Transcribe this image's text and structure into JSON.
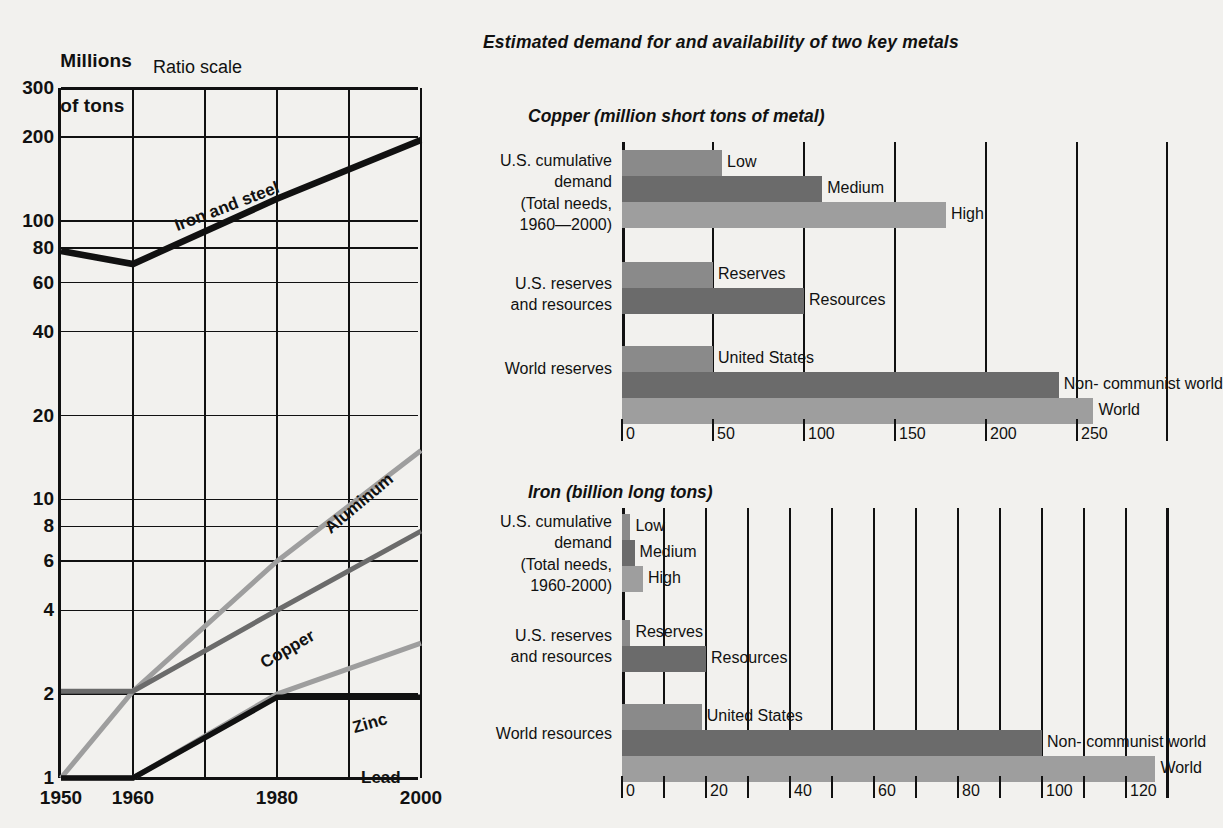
{
  "main_title": "Estimated demand for and availability of two key metals",
  "line_chart": {
    "axis_title_line1": "Millions",
    "axis_title_line2": "of tons",
    "scale_note": "Ratio scale",
    "y_ticks": [
      "300",
      "200",
      "100",
      "80",
      "60",
      "40",
      "20",
      "10",
      "8",
      "6",
      "4",
      "2",
      "1"
    ],
    "x_ticks": [
      "1950",
      "1960",
      "1980",
      "2000"
    ],
    "series_labels": [
      "Iron and steel",
      "Aluminum",
      "Copper",
      "Zinc",
      "Lead"
    ]
  },
  "copper_chart": {
    "title": "Copper (million short tons of metal)",
    "axis_ticks": [
      "0",
      "50",
      "100",
      "150",
      "200",
      "250"
    ],
    "groups": [
      {
        "label": "U.S. cumulative\ndemand\n(Total needs,\n1960—2000)",
        "bars": [
          {
            "name": "Low",
            "value": 55
          },
          {
            "name": "Medium",
            "value": 110
          },
          {
            "name": "High",
            "value": 178
          }
        ]
      },
      {
        "label": "U.S. reserves\nand resources",
        "bars": [
          {
            "name": "Reserves",
            "value": 50
          },
          {
            "name": "Resources",
            "value": 100
          }
        ]
      },
      {
        "label": "World reserves",
        "bars": [
          {
            "name": "United States",
            "value": 50
          },
          {
            "name": "Non- communist world",
            "value": 240
          },
          {
            "name": "World",
            "value": 259
          }
        ]
      }
    ]
  },
  "iron_chart": {
    "title": "Iron (billion long tons)",
    "axis_ticks": [
      "0",
      "20",
      "40",
      "60",
      "80",
      "100",
      "120"
    ],
    "groups": [
      {
        "label": "U.S. cumulative\ndemand\n(Total needs,\n1960-2000)",
        "bars": [
          {
            "name": "Low",
            "value": 2
          },
          {
            "name": "Medium",
            "value": 3
          },
          {
            "name": "High",
            "value": 5
          }
        ]
      },
      {
        "label": "U.S. reserves\nand resources",
        "bars": [
          {
            "name": "Reserves",
            "value": 2
          },
          {
            "name": "Resources",
            "value": 20
          }
        ]
      },
      {
        "label": "World resources",
        "bars": [
          {
            "name": "United States",
            "value": 19
          },
          {
            "name": "Non- communist world",
            "value": 100
          },
          {
            "name": "World",
            "value": 127
          }
        ]
      }
    ]
  },
  "chart_data": [
    {
      "type": "line",
      "title": "Millions of tons (Ratio scale)",
      "xlabel": "",
      "ylabel": "Millions of tons",
      "yscale": "log",
      "ylim": [
        1,
        300
      ],
      "ytick_values": [
        300,
        200,
        100,
        80,
        60,
        40,
        20,
        10,
        8,
        6,
        4,
        2,
        1
      ],
      "x": [
        1950,
        1960,
        1980,
        2000
      ],
      "xlim": [
        1950,
        2000
      ],
      "grid": true,
      "legend": "inline-labels",
      "series": [
        {
          "name": "Iron and steel",
          "values": [
            78,
            70,
            120,
            195
          ],
          "color": "#111111"
        },
        {
          "name": "Aluminum",
          "values": [
            1,
            2.05,
            6,
            15
          ],
          "color": "#9e9e9e"
        },
        {
          "name": "Copper",
          "values": [
            2.05,
            2.05,
            4,
            7.7
          ],
          "color": "#6b6b6b"
        },
        {
          "name": "Zinc",
          "values": [
            1,
            1,
            2,
            3.05
          ],
          "color": "#9e9e9e"
        },
        {
          "name": "Lead",
          "values": [
            1,
            1,
            1.95,
            1.95
          ],
          "color": "#111111"
        }
      ]
    },
    {
      "type": "bar",
      "orientation": "horizontal",
      "title": "Copper (million short tons of metal)",
      "xlabel": "million short tons of metal",
      "xlim": [
        0,
        300
      ],
      "xticks": [
        0,
        50,
        100,
        150,
        200,
        250
      ],
      "grid": true,
      "categories": [
        "U.S. cumulative demand: Low",
        "U.S. cumulative demand: Medium",
        "U.S. cumulative demand: High",
        "U.S. reserves and resources: Reserves",
        "U.S. reserves and resources: Resources",
        "World reserves: United States",
        "World reserves: Non- communist world",
        "World reserves: World"
      ],
      "values": [
        55,
        110,
        178,
        50,
        100,
        50,
        240,
        259
      ]
    },
    {
      "type": "bar",
      "orientation": "horizontal",
      "title": "Iron (billion long tons)",
      "xlabel": "billion long tons",
      "xlim": [
        0,
        130
      ],
      "xticks": [
        0,
        20,
        40,
        60,
        80,
        100,
        120
      ],
      "minor_xticks": [
        10,
        30,
        50,
        70,
        90,
        110,
        130
      ],
      "grid": true,
      "categories": [
        "U.S. cumulative demand: Low",
        "U.S. cumulative demand: Medium",
        "U.S. cumulative demand: High",
        "U.S. reserves and resources: Reserves",
        "U.S. reserves and resources: Resources",
        "World resources: United States",
        "World resources: Non- communist world",
        "World resources: World"
      ],
      "values": [
        2,
        3,
        5,
        2,
        20,
        19,
        100,
        127
      ]
    }
  ],
  "colors": {
    "light_gray": "#9e9e9e",
    "mid_gray": "#8a8a8a",
    "dark_gray": "#6b6b6b",
    "black": "#111111",
    "background": "#f2f1ee"
  }
}
